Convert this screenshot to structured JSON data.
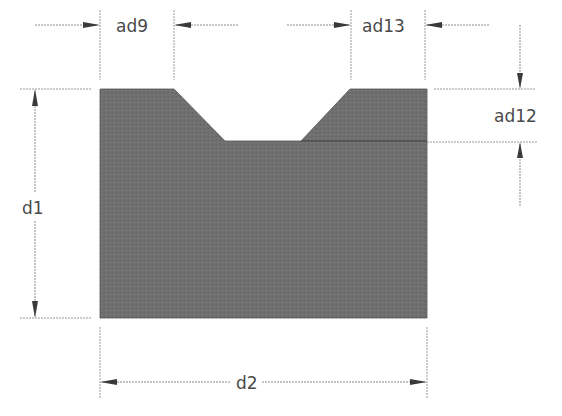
{
  "diagram": {
    "type": "engineering dimension drawing",
    "shape_fill": "#6e6e6e",
    "labels": {
      "notch_left_top_width": "ad9",
      "notch_right_top_width": "ad13",
      "notch_depth": "ad12",
      "height": "d1",
      "width": "d2"
    }
  }
}
